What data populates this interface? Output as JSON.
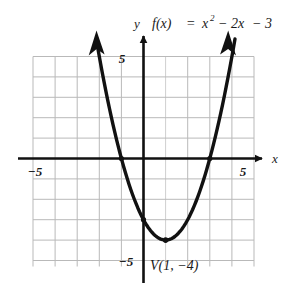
{
  "figure": {
    "kind": "coordinate-plane-graph",
    "title_parts": {
      "y_axis_letter": "y",
      "f_of_x": "f(x)",
      "equals": "=",
      "term_x": "x",
      "exponent": "2",
      "term_linear": "− 2x",
      "term_constant": "− 3"
    },
    "vertex_label": "V(1, −4)",
    "axis_labels": {
      "x": "x",
      "y": "y"
    },
    "tick_labels": {
      "x_negative": "−5",
      "x_positive": "5",
      "y_positive": "5",
      "y_negative": "−5"
    },
    "colors": {
      "curve": "#111111",
      "axis": "#111111",
      "grid": "#b9b9b9",
      "text": "#1a1a1a",
      "background": "#ffffff"
    }
  },
  "chart_data": {
    "type": "line",
    "xlabel": "x",
    "ylabel": "y",
    "xlim": [
      -5,
      5
    ],
    "ylim": [
      -5,
      5
    ],
    "grid": true,
    "legend": "none",
    "function": "f(x) = x^2 - 2x - 3",
    "curve_shape": "parabola-opening-upward",
    "vertex": {
      "x": 1,
      "y": -4,
      "label": "V(1, −4)"
    },
    "x_intercepts": [
      -1,
      3
    ],
    "y_intercept": -3,
    "axis_of_symmetry": 1,
    "x_tick_labels": [
      {
        "value": -5,
        "label": "−5"
      },
      {
        "value": 5,
        "label": "5"
      }
    ],
    "y_tick_labels": [
      {
        "value": 5,
        "label": "5"
      },
      {
        "value": -5,
        "label": "−5"
      }
    ],
    "gridline_step": 1,
    "series": [
      {
        "name": "f(x) = x² − 2x − 3",
        "x": [
          -2.4,
          -2.0,
          -1.5,
          -1.0,
          -0.5,
          0.0,
          0.5,
          1.0,
          1.5,
          2.0,
          2.5,
          3.0,
          3.5,
          4.0,
          4.4
        ],
        "values": [
          8.56,
          5.0,
          2.25,
          0.0,
          -1.75,
          -3.0,
          -3.75,
          -4.0,
          -3.75,
          -3.0,
          -1.75,
          0.0,
          2.25,
          5.0,
          7.16
        ]
      }
    ],
    "marked_points": [
      {
        "x": -1,
        "y": 0,
        "kind": "x-intercept"
      },
      {
        "x": 3,
        "y": 0,
        "kind": "x-intercept"
      },
      {
        "x": 0,
        "y": -3,
        "kind": "y-intercept"
      },
      {
        "x": 1,
        "y": -4,
        "kind": "vertex"
      }
    ],
    "annotations": [
      {
        "text": "V(1, −4)",
        "x": 1,
        "y": -4.9,
        "describes": "vertex"
      }
    ]
  }
}
